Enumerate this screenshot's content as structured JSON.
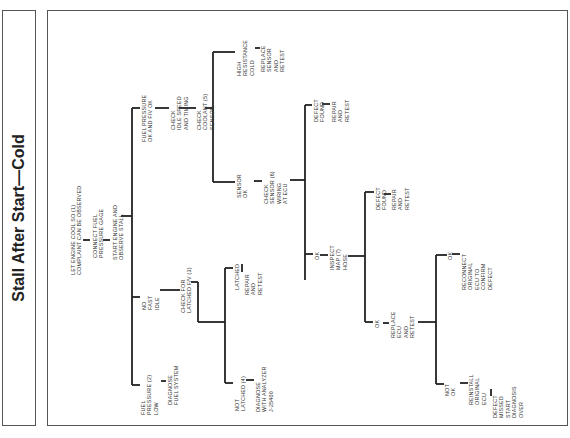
{
  "title": "Stall After Start—Cold",
  "colors": {
    "line": "#222222",
    "frame": "#555555",
    "text": "#333333",
    "background": "#ffffff"
  },
  "nodes": {
    "start": "LET ENGINE COOL SO (1)\nCOMPLAINT CAN BE OBSERVED",
    "connect": "CONNECT FUEL\nPRESSURE GAGE",
    "observe": "START ENGINE AND\nOBSERVE STALL",
    "fp_low": "FUEL\nPRESSURE (2)\nLOW",
    "diag_fuel": "DIAGNOSE\nFUEL SYSTEM",
    "no_fast_idle": "NO\nFAST\nIDLE",
    "check_latched": "CHECK FOR\nLATCHED F/V (3)",
    "latched": "LATCHED",
    "latched_repair": "REPAIR\nAND\nRETEST",
    "not_latched": "NOT\nLATCHED (4)",
    "diag_analyzer": "DIAGNOSE\nWITH ANALYZER\nJ-25400",
    "fp_ok": "FUEL PRESSURE\nOK AND F/V OK",
    "check_idle": "CHECK\nIDLE SPEED\nAND TIMING",
    "check_coolant": "CHECK\nCOOLANT (5)\nSENSOR",
    "high_res": "HIGH\nRESISTANCE\nCOLD",
    "replace_sensor": "REPLACE\nSENSOR\nAND\nRETEST",
    "sensor_ok": "SENSOR\nOK",
    "check_wiring": "CHECK\nSENSOR (6)\nWIRING\nAT ECU",
    "wiring_defect": "DEFECT\nFOUND",
    "wiring_repair": "REPAIR\nAND\nRETEST",
    "wiring_ok": "OK",
    "inspect_map": "INSPECT\nMAP (7)\nHOSE",
    "map_defect": "DEFECT\nFOUND",
    "map_repair": "REPAIR\nAND\nRETEST",
    "map_ok": "OK",
    "replace_ecu": "REPLACE\nECU\nAND\nRETEST",
    "ecu_ok": "OK",
    "reconnect": "RECONNECT\nORIGINAL\nECU TO\nCONFIRM\nDEFECT",
    "ecu_not_ok": "NOT\nOK",
    "reinstall": "REINSTALL\nORIGINAL\nECU",
    "defect_missed": "DEFECT\nMISSED\nSTART\nDIAGNOSIS\nOVER"
  }
}
